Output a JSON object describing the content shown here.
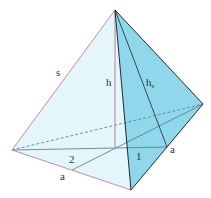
{
  "diagram": {
    "type": "regular triangular pyramid",
    "labels": {
      "slant_edge": "s",
      "height": "h",
      "slant_height": "h",
      "slant_height_sub": "s",
      "base_edge_left": "a",
      "base_edge_right": "a",
      "ratio_long": "2",
      "ratio_short": "1"
    },
    "colors": {
      "left_face": "#e2f6fb",
      "right_face": "#8fd8ec",
      "base": "#d6f1f8",
      "edge_dark": "#1f2a30",
      "edge_pink": "#d4889e",
      "inner_line": "#5a7480"
    },
    "vertices": {
      "apex": [
        115,
        10
      ],
      "left": [
        12,
        150
      ],
      "front": [
        131,
        190
      ],
      "right": [
        203,
        104
      ],
      "foot": [
        115,
        149
      ]
    }
  }
}
